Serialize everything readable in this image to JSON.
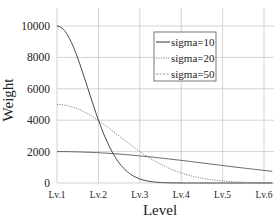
{
  "chart_data": {
    "type": "line",
    "title": "",
    "xlabel": "Level",
    "ylabel": "Weight",
    "categories": [
      "Lv.1",
      "Lv.2",
      "Lv.3",
      "Lv.4",
      "Lv.5",
      "Lv.6"
    ],
    "yticks": [
      0,
      2000,
      4000,
      6000,
      8000,
      10000
    ],
    "ylim": [
      0,
      10000
    ],
    "xlim": [
      1,
      6.2
    ],
    "grid": true,
    "legend_position": "upper right",
    "series": [
      {
        "name": "sigma=10",
        "style": "solid",
        "peak": 10000,
        "spread_levels": 0.74,
        "values_at_levels": [
          10000,
          4000,
          260,
          0,
          0,
          0
        ]
      },
      {
        "name": "sigma=20",
        "style": "dotted",
        "peak": 5000,
        "spread_levels": 1.48,
        "values_at_levels": [
          5000,
          3980,
          2000,
          640,
          130,
          15
        ]
      },
      {
        "name": "sigma=50",
        "style": "dashed-light",
        "peak": 2000,
        "spread_levels": 3.7,
        "values_at_levels": [
          2000,
          1930,
          1730,
          1440,
          1110,
          800
        ]
      }
    ]
  },
  "plot": {
    "x0": 57,
    "xstep": 41.4,
    "y0": 183,
    "ypx_per_unit": 0.0157,
    "right": 272,
    "top": 8
  },
  "legend": {
    "items": [
      "sigma=10",
      "sigma=20",
      "sigma=50"
    ]
  }
}
